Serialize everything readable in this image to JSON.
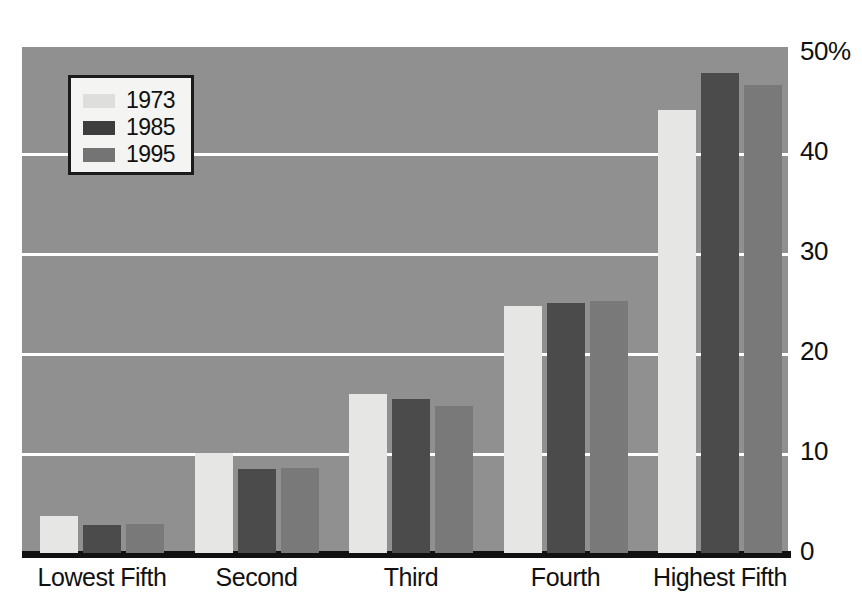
{
  "chart_data": {
    "type": "bar",
    "title": "",
    "xlabel": "",
    "ylabel": "",
    "categories": [
      "Lowest Fifth",
      "Second",
      "Third",
      "Fourth",
      "Highest Fifth"
    ],
    "series": [
      {
        "name": "1973",
        "color": "#e6e6e4",
        "values": [
          3.7,
          10.0,
          15.9,
          24.7,
          44.3
        ]
      },
      {
        "name": "1985",
        "color": "#4b4b4b",
        "values": [
          2.8,
          8.4,
          15.4,
          25.0,
          48.0
        ]
      },
      {
        "name": "1995",
        "color": "#797979",
        "values": [
          2.9,
          8.5,
          14.7,
          25.2,
          46.8
        ]
      }
    ],
    "ylim": [
      0,
      50
    ],
    "yticks": [
      0,
      10,
      20,
      30,
      40,
      50
    ],
    "ytick_labels": [
      "0",
      "10",
      "20",
      "30",
      "40",
      "50%"
    ],
    "grid": true,
    "gridline_color": "#ffffff",
    "legend_position": "top-left",
    "plot_background": "#909090",
    "axis_color": "#111111"
  },
  "legend": {
    "entries": [
      {
        "label": "1973"
      },
      {
        "label": "1985"
      },
      {
        "label": "1995"
      }
    ]
  }
}
